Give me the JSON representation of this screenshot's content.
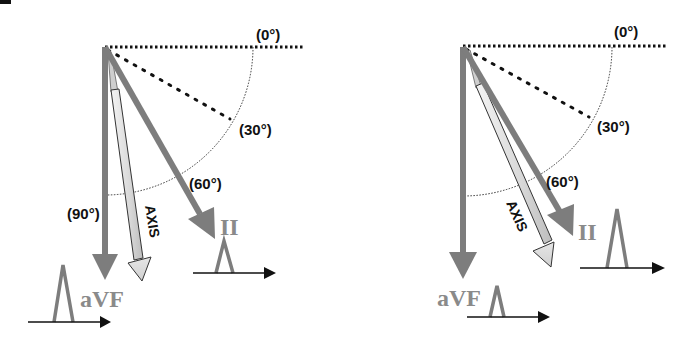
{
  "colors": {
    "lead_vector": "#7d7d7d",
    "lead_label": "#8a8a8a",
    "reference_line": "#111111",
    "axis_fill_light": "#f4f4f4",
    "axis_fill_dark": "#bdbdbd",
    "text": "#111111"
  },
  "corner_mark": "",
  "panels": [
    {
      "id": "left",
      "angles": {
        "zero": "(0°)",
        "thirty": "(30°)",
        "sixty": "(60°)",
        "ninety": "(90°)"
      },
      "leads": {
        "avf": "aVF",
        "ii": "II"
      },
      "axis_label": "AXIS",
      "description": "Axis between 60° and 90°; aVF waveform taller than lead II"
    },
    {
      "id": "right",
      "angles": {
        "zero": "(0°)",
        "thirty": "(30°)",
        "sixty": "(60°)"
      },
      "leads": {
        "avf": "aVF",
        "ii": "II"
      },
      "axis_label": "AXIS",
      "description": "Axis close to 60°; lead II waveform taller than aVF"
    }
  ]
}
